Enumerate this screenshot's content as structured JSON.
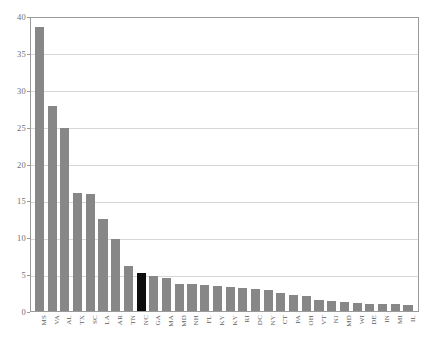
{
  "caption": {
    "text": ""
  },
  "chart_data": {
    "type": "bar",
    "title": "",
    "subtitle": "",
    "xlabel": "",
    "ylabel": "",
    "ylim": [
      0,
      40
    ],
    "ytick_values": [
      0,
      5,
      10,
      15,
      20,
      25,
      30,
      35,
      40
    ],
    "ytick_labels": [
      "0",
      "5",
      "10",
      "15",
      "20",
      "25",
      "30",
      "35",
      "40"
    ],
    "grid": "horizontal",
    "legend": "none",
    "bar_color": "#878787",
    "highlight_color": "#0d0d0d",
    "highlight_category": "NC",
    "categories": [
      "MS",
      "VA",
      "AL",
      "TX",
      "SC",
      "LA",
      "AR",
      "TN",
      "NC",
      "GA",
      "MA",
      "MD",
      "NH",
      "FL",
      "KY",
      "KY",
      "RI",
      "DC",
      "NY",
      "CT",
      "PA",
      "OH",
      "VT",
      "NJ",
      "MD",
      "WI",
      "DE",
      "IN",
      "MI",
      "IL"
    ],
    "values": [
      38.5,
      27.8,
      24.8,
      16.0,
      15.8,
      12.5,
      9.8,
      6.1,
      5.1,
      4.8,
      4.5,
      3.7,
      3.6,
      3.5,
      3.4,
      3.3,
      3.1,
      3.0,
      2.9,
      2.4,
      2.2,
      2.1,
      1.5,
      1.4,
      1.2,
      1.1,
      1.0,
      0.9,
      0.9,
      0.8
    ]
  }
}
